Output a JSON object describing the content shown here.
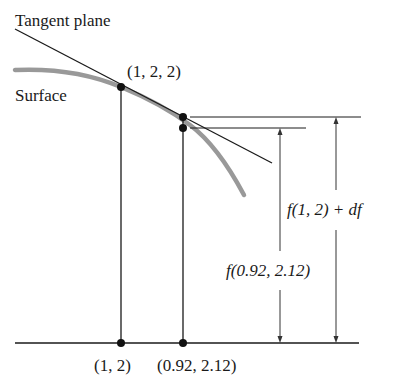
{
  "diagram": {
    "title_label": "Tangent plane",
    "surface_label": "Surface",
    "point_label_3d": "(1, 2, 2)",
    "base_point_1": "(1, 2)",
    "base_point_2": "(0.92, 2.12)",
    "height_label_df": "f(1, 2) + df",
    "height_label_f": "f(0.92, 2.12)",
    "colors": {
      "line": "#1a1a1a",
      "surface_curve": "#999999",
      "background": "#ffffff"
    }
  }
}
